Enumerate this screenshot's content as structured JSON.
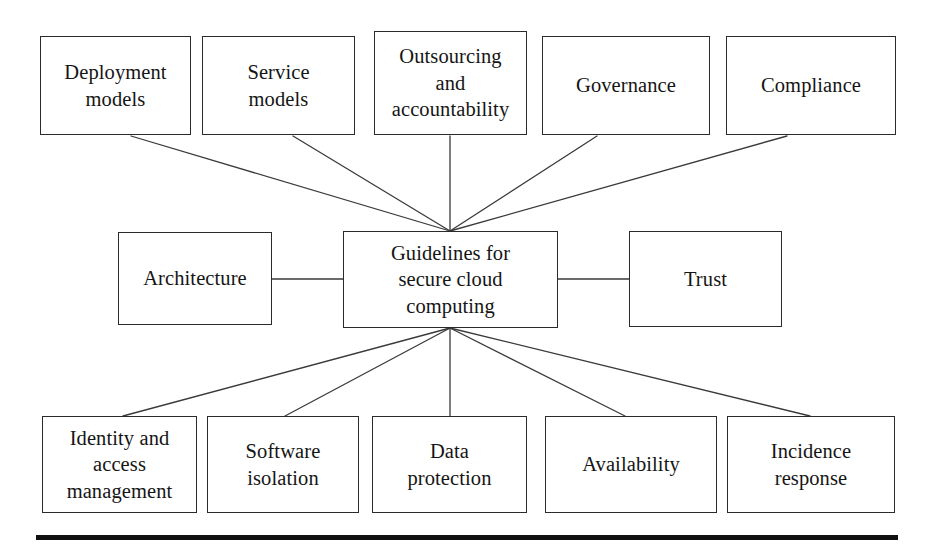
{
  "diagram": {
    "title": "Guidelines for secure cloud computing",
    "type": "hub-and-spoke",
    "center": {
      "id": "center",
      "label": "Guidelines for\nsecure cloud\ncomputing",
      "x": 343,
      "y": 231,
      "w": 215,
      "h": 97
    },
    "top_row": [
      {
        "id": "deployment-models",
        "label": "Deployment\nmodels",
        "x": 40,
        "y": 36,
        "w": 151,
        "h": 99
      },
      {
        "id": "service-models",
        "label": "Service\nmodels",
        "x": 202,
        "y": 36,
        "w": 153,
        "h": 99
      },
      {
        "id": "outsourcing-accountability",
        "label": "Outsourcing\nand\naccountability",
        "x": 374,
        "y": 31,
        "w": 153,
        "h": 104
      },
      {
        "id": "governance",
        "label": "Governance",
        "x": 542,
        "y": 36,
        "w": 168,
        "h": 99
      },
      {
        "id": "compliance",
        "label": "Compliance",
        "x": 726,
        "y": 36,
        "w": 170,
        "h": 99
      }
    ],
    "middle_row": [
      {
        "id": "architecture",
        "label": "Architecture",
        "x": 118,
        "y": 232,
        "w": 154,
        "h": 93
      },
      {
        "id": "trust",
        "label": "Trust",
        "x": 629,
        "y": 231,
        "w": 153,
        "h": 96
      }
    ],
    "bottom_row": [
      {
        "id": "identity-access-management",
        "label": "Identity and\naccess\nmanagement",
        "x": 42,
        "y": 416,
        "w": 155,
        "h": 97
      },
      {
        "id": "software-isolation",
        "label": "Software\nisolation",
        "x": 207,
        "y": 416,
        "w": 152,
        "h": 97
      },
      {
        "id": "data-protection",
        "label": "Data\nprotection",
        "x": 372,
        "y": 416,
        "w": 155,
        "h": 97
      },
      {
        "id": "availability",
        "label": "Availability",
        "x": 545,
        "y": 416,
        "w": 172,
        "h": 97
      },
      {
        "id": "incidence-response",
        "label": "Incidence\nresponse",
        "x": 727,
        "y": 416,
        "w": 168,
        "h": 97
      }
    ],
    "connectors": [
      {
        "from": "deployment-models",
        "to": "center",
        "x1": 131,
        "y1": 136,
        "x2": 450,
        "y2": 231
      },
      {
        "from": "service-models",
        "to": "center",
        "x1": 293,
        "y1": 136,
        "x2": 450,
        "y2": 231
      },
      {
        "from": "outsourcing-accountability",
        "to": "center",
        "x1": 450,
        "y1": 136,
        "x2": 450,
        "y2": 231
      },
      {
        "from": "governance",
        "to": "center",
        "x1": 597,
        "y1": 136,
        "x2": 450,
        "y2": 231
      },
      {
        "from": "compliance",
        "to": "center",
        "x1": 787,
        "y1": 136,
        "x2": 450,
        "y2": 231
      },
      {
        "from": "architecture",
        "to": "center",
        "x1": 272,
        "y1": 279,
        "x2": 343,
        "y2": 279
      },
      {
        "from": "trust",
        "to": "center",
        "x1": 558,
        "y1": 279,
        "x2": 629,
        "y2": 279
      },
      {
        "from": "center",
        "to": "identity-access-management",
        "x1": 450,
        "y1": 328,
        "x2": 123,
        "y2": 416
      },
      {
        "from": "center",
        "to": "software-isolation",
        "x1": 450,
        "y1": 328,
        "x2": 285,
        "y2": 416
      },
      {
        "from": "center",
        "to": "data-protection",
        "x1": 450,
        "y1": 328,
        "x2": 450,
        "y2": 416
      },
      {
        "from": "center",
        "to": "availability",
        "x1": 450,
        "y1": 328,
        "x2": 625,
        "y2": 416
      },
      {
        "from": "center",
        "to": "incidence-response",
        "x1": 450,
        "y1": 328,
        "x2": 810,
        "y2": 416
      }
    ],
    "rule": {
      "x": 36,
      "y": 535,
      "w": 862,
      "h": 5
    },
    "colors": {
      "box_stroke": "#2b2b2b",
      "connector_stroke": "#3a3a3a",
      "text": "#151515",
      "background": "#ffffff",
      "rule": "#101010"
    }
  }
}
